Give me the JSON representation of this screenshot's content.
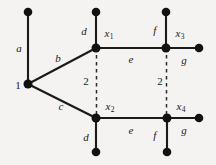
{
  "figure": {
    "type": "graph-diagram",
    "background_color": "#f4f3f1",
    "stroke_color": "#1a1a1a",
    "width": 216,
    "height": 165
  },
  "vertices": [
    {
      "id": "v_a_top",
      "label": "",
      "x": 28,
      "y": 12,
      "filled": true
    },
    {
      "id": "v_1",
      "label": "1",
      "x": 28,
      "y": 84,
      "filled": true
    },
    {
      "id": "v_d1_top",
      "label": "",
      "x": 96,
      "y": 12,
      "filled": true
    },
    {
      "id": "v_x1",
      "label": "x",
      "sub": "1",
      "x": 96,
      "y": 48,
      "filled": true
    },
    {
      "id": "v_f_top",
      "label": "",
      "x": 166,
      "y": 12,
      "filled": true
    },
    {
      "id": "v_x3",
      "label": "x",
      "sub": "3",
      "x": 166,
      "y": 48,
      "filled": true
    },
    {
      "id": "v_g_end",
      "label": "",
      "x": 199,
      "y": 48,
      "filled": true
    },
    {
      "id": "v_x2",
      "label": "x",
      "sub": "2",
      "x": 96,
      "y": 118,
      "filled": true
    },
    {
      "id": "v_d2_bot",
      "label": "",
      "x": 96,
      "y": 152,
      "filled": true
    },
    {
      "id": "v_x4",
      "label": "x",
      "sub": "4",
      "x": 167,
      "y": 118,
      "filled": true
    },
    {
      "id": "v_f2_bot",
      "label": "",
      "x": 167,
      "y": 152,
      "filled": true
    },
    {
      "id": "v_g2_end",
      "label": "",
      "x": 199,
      "y": 118,
      "filled": true
    }
  ],
  "edges": [
    {
      "id": "e_a",
      "label": "a",
      "style": "solid",
      "from": "v_a_top",
      "to": "v_1"
    },
    {
      "id": "e_b",
      "label": "b",
      "style": "solid",
      "from": "v_1",
      "to": "v_x1"
    },
    {
      "id": "e_c",
      "label": "c",
      "style": "solid",
      "from": "v_1",
      "to": "v_x2"
    },
    {
      "id": "e_d1",
      "label": "d",
      "style": "solid",
      "from": "v_d1_top",
      "to": "v_x1"
    },
    {
      "id": "e_e1",
      "label": "e",
      "style": "solid",
      "from": "v_x1",
      "to": "v_x3"
    },
    {
      "id": "e_f1",
      "label": "f",
      "style": "solid",
      "from": "v_f_top",
      "to": "v_x3"
    },
    {
      "id": "e_g1",
      "label": "g",
      "style": "solid",
      "from": "v_x3",
      "to": "v_g_end"
    },
    {
      "id": "e_d2",
      "label": "d",
      "style": "solid",
      "from": "v_x2",
      "to": "v_d2_bot"
    },
    {
      "id": "e_e2",
      "label": "e",
      "style": "solid",
      "from": "v_x2",
      "to": "v_x4"
    },
    {
      "id": "e_f2",
      "label": "f",
      "style": "solid",
      "from": "v_x4",
      "to": "v_f2_bot"
    },
    {
      "id": "e_g2",
      "label": "g",
      "style": "solid",
      "from": "v_x4",
      "to": "v_g2_end"
    },
    {
      "id": "e_dash1",
      "label": "2",
      "style": "dashed",
      "from": "v_x1",
      "to": "v_x2"
    },
    {
      "id": "e_dash2",
      "label": "2",
      "style": "dashed",
      "from": "v_x3",
      "to": "v_x4"
    }
  ],
  "labels": {
    "vertex_1": "1",
    "x1": "x",
    "x1_sub": "1",
    "x2": "x",
    "x2_sub": "2",
    "x3": "x",
    "x3_sub": "3",
    "x4": "x",
    "x4_sub": "4",
    "edge_a": "a",
    "edge_b": "b",
    "edge_c": "c",
    "edge_d_top": "d",
    "edge_d_bottom": "d",
    "edge_e_top": "e",
    "edge_e_bottom": "e",
    "edge_f_top": "f",
    "edge_f_bottom": "f",
    "edge_g_top": "g",
    "edge_g_bottom": "g",
    "dashed_left": "2",
    "dashed_right": "2"
  }
}
